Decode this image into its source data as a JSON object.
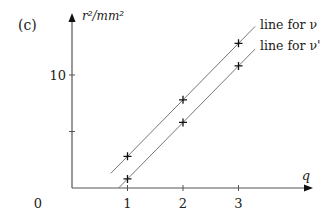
{
  "panel_label": "(c)",
  "chart_data": {
    "type": "line",
    "title": "",
    "xlabel": "q",
    "ylabel": "r²/mm²",
    "origin_label": "0",
    "x_ticks": [
      1,
      2,
      3
    ],
    "x_tick_labels": [
      "1",
      "2",
      "3"
    ],
    "y_ticks": [
      5,
      10
    ],
    "y_tick_labels": [
      "",
      "10"
    ],
    "xlim": [
      0,
      3.4
    ],
    "ylim": [
      0,
      15.3
    ],
    "grid": false,
    "legend_position": "inline-right",
    "x": [
      1,
      2,
      3
    ],
    "series": [
      {
        "name": "line for ν",
        "label": "line for ν",
        "values": [
          2.8,
          7.8,
          12.8
        ],
        "line_x_range": [
          0.7,
          3.3
        ]
      },
      {
        "name": "line for ν'",
        "label": "line for ν'",
        "values": [
          0.8,
          5.8,
          10.8
        ],
        "line_x_range": [
          0.8,
          3.3
        ]
      }
    ]
  },
  "colors": {
    "axis": "#555555",
    "line": "#777777",
    "marker": "#111111",
    "text": "#222222"
  }
}
